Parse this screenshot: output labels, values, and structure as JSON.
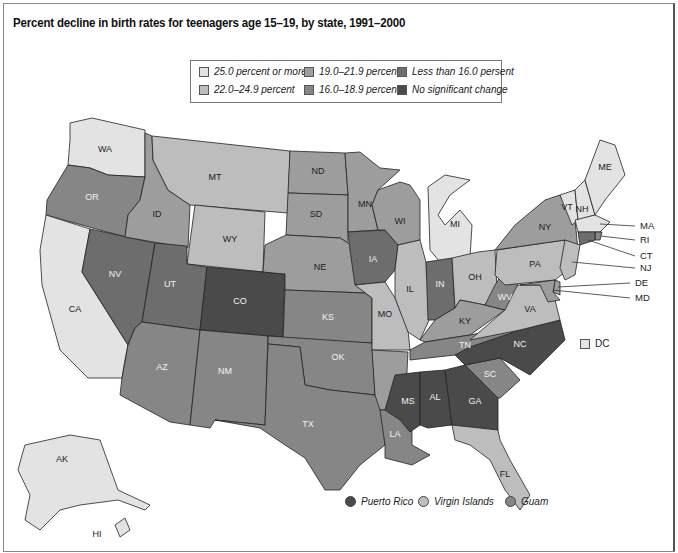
{
  "title": "Percent decline in birth rates for teenagers age 15–19, by state, 1991–2000",
  "colors": {
    "c25plus": "#e3e3e3",
    "c22_249": "#bdbdbd",
    "c19_219": "#9d9d9d",
    "c16_189": "#868686",
    "c_lt16": "#6d6d6d",
    "c_nochange": "#4a4a4a"
  },
  "legend": [
    {
      "key": "c25plus",
      "label": "25.0 percent or more"
    },
    {
      "key": "c22_249",
      "label": "22.0–24.9 percent"
    },
    {
      "key": "c19_219",
      "label": "19.0–21.9 percent"
    },
    {
      "key": "c16_189",
      "label": "16.0–18.9 percent"
    },
    {
      "key": "c_lt16",
      "label": "Less than 16.0 persent"
    },
    {
      "key": "c_nochange",
      "label": "No significant change"
    }
  ],
  "states": {
    "WA": "c25plus",
    "OR": "c16_189",
    "CA": "c25plus",
    "NV": "c_lt16",
    "ID": "c19_219",
    "MT": "c22_249",
    "WY": "c22_249",
    "UT": "c_lt16",
    "CO": "c_nochange",
    "AZ": "c16_189",
    "NM": "c16_189",
    "ND": "c19_219",
    "SD": "c19_219",
    "NE": "c19_219",
    "KS": "c16_189",
    "OK": "c16_189",
    "TX": "c16_189",
    "MN": "c19_219",
    "IA": "c_lt16",
    "MO": "c22_249",
    "AR": "c19_219",
    "LA": "c16_189",
    "WI": "c19_219",
    "IL": "c22_249",
    "MI": "c25plus",
    "IN": "c_lt16",
    "OH": "c22_249",
    "KY": "c19_219",
    "TN": "c16_189",
    "MS": "c_nochange",
    "AL": "c_nochange",
    "GA": "c_nochange",
    "FL": "c22_249",
    "SC": "c16_189",
    "NC": "c_nochange",
    "VA": "c22_249",
    "WV": "c16_189",
    "PA": "c22_249",
    "NY": "c19_219",
    "VT": "c25plus",
    "NH": "c25plus",
    "ME": "c25plus",
    "MA": "c25plus",
    "RI": "c16_189",
    "CT": "c_lt16",
    "NJ": "c22_249",
    "DE": "c19_219",
    "MD": "c19_219",
    "AK": "c25plus",
    "HI": "c25plus",
    "DC": "c25plus"
  },
  "labels": {
    "WA": "WA",
    "OR": "OR",
    "CA": "CA",
    "NV": "NV",
    "ID": "ID",
    "MT": "MT",
    "WY": "WY",
    "UT": "UT",
    "CO": "CO",
    "AZ": "AZ",
    "NM": "NM",
    "ND": "ND",
    "SD": "SD",
    "NE": "NE",
    "KS": "KS",
    "OK": "OK",
    "TX": "TX",
    "MN": "MN",
    "IA": "IA",
    "MO": "MO",
    "AR": "",
    "LA": "LA",
    "WI": "WI",
    "IL": "IL",
    "MI": "MI",
    "IN": "IN",
    "OH": "OH",
    "KY": "KY",
    "TN": "TN",
    "MS": "MS",
    "AL": "AL",
    "GA": "GA",
    "FL": "FL",
    "SC": "SC",
    "NC": "NC",
    "VA": "VA",
    "WV": "WV",
    "PA": "PA",
    "NY": "NY",
    "VT": "VT",
    "NH": "NH",
    "ME": "ME",
    "AK": "AK",
    "HI": "HI"
  },
  "callouts": {
    "MA": "MA",
    "RI": "RI",
    "CT": "CT",
    "NJ": "NJ",
    "DE": "DE",
    "MD": "MD"
  },
  "dc_label": "DC",
  "territories": [
    {
      "key": "c_nochange",
      "label": "Puerto Rico"
    },
    {
      "key": "c22_249",
      "label": "Virgin Islands"
    },
    {
      "key": "c16_189",
      "label": "Guam"
    }
  ]
}
